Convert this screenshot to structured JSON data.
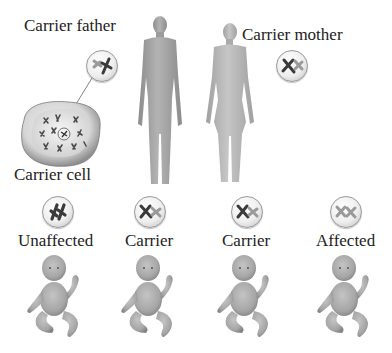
{
  "diagram": {
    "parents": {
      "father": {
        "label": "Carrier father",
        "genotype": "carrier"
      },
      "mother": {
        "label": "Carrier mother",
        "genotype": "carrier"
      }
    },
    "cell": {
      "label": "Carrier cell"
    },
    "offspring": [
      {
        "label": "Unaffected",
        "genotype": "unaffected"
      },
      {
        "label": "Carrier",
        "genotype": "carrier"
      },
      {
        "label": "Carrier",
        "genotype": "carrier"
      },
      {
        "label": "Affected",
        "genotype": "affected"
      }
    ],
    "colors": {
      "skin": "#a9a9a9",
      "skin_dark": "#8a8a8a",
      "chromosome_normal": "#3a3a3a",
      "chromosome_mutant": "#9a9a9a",
      "text": "#222222"
    }
  }
}
